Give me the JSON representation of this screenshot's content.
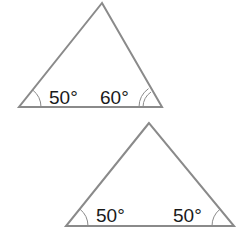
{
  "diagram": {
    "type": "triangles-angle-comparison",
    "triangles": [
      {
        "id": "top",
        "vertices": {
          "apex": [
            102,
            3
          ],
          "base_left": [
            19,
            107
          ],
          "base_right": [
            162,
            107
          ]
        },
        "angles": [
          {
            "vertex": "base_left",
            "label": "50°",
            "marks": 1
          },
          {
            "vertex": "base_right",
            "label": "60°",
            "marks": 2
          }
        ]
      },
      {
        "id": "bottom",
        "vertices": {
          "apex": [
            149,
            123
          ],
          "base_left": [
            66,
            226
          ],
          "base_right": [
            234,
            226
          ]
        },
        "angles": [
          {
            "vertex": "base_left",
            "label": "50°",
            "marks": 1
          },
          {
            "vertex": "base_right",
            "label": "50°",
            "marks": 1
          }
        ]
      }
    ],
    "colors": {
      "stroke": "#8a8a8a",
      "text": "#1a1a1a",
      "background": "#ffffff"
    }
  },
  "labels": {
    "top_left_angle": "50°",
    "top_right_angle": "60°",
    "bottom_left_angle": "50°",
    "bottom_right_angle": "50°"
  }
}
